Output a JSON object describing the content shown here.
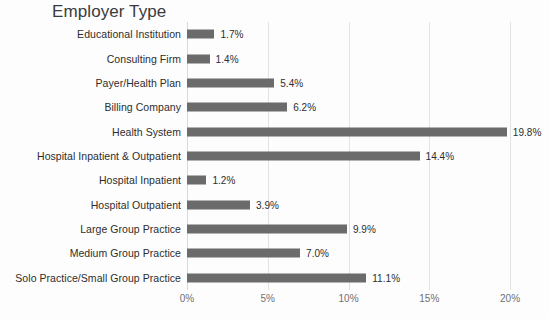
{
  "chart_data": {
    "type": "bar",
    "orientation": "horizontal",
    "title": "Employer Type",
    "xlabel": "",
    "ylabel": "",
    "xlim": [
      0,
      20
    ],
    "grid": true,
    "legend": false,
    "bar_color": "#6b6b6b",
    "gridline_color": "#e2e2e2",
    "label_color": "#2d2d2d",
    "tick_color": "#707070",
    "background_color": "#fdfdfd",
    "tick_labels": [
      "0%",
      "5%",
      "10%",
      "15%",
      "20%"
    ],
    "tick_values": [
      0,
      5,
      10,
      15,
      20
    ],
    "categories": [
      "Educational Institution",
      "Consulting Firm",
      "Payer/Health Plan",
      "Billing Company",
      "Health System",
      "Hospital Inpatient & Outpatient",
      "Hospital Inpatient",
      "Hospital Outpatient",
      "Large Group Practice",
      "Medium Group Practice",
      "Solo Practice/Small Group Practice"
    ],
    "values": [
      1.7,
      1.4,
      5.4,
      6.2,
      19.8,
      14.4,
      1.2,
      3.9,
      9.9,
      7.0,
      11.1
    ],
    "value_labels": [
      "1.7%",
      "1.4%",
      "5.4%",
      "6.2%",
      "19.8%",
      "14.4%",
      "1.2%",
      "3.9%",
      "9.9%",
      "7.0%",
      "11.1%"
    ]
  }
}
